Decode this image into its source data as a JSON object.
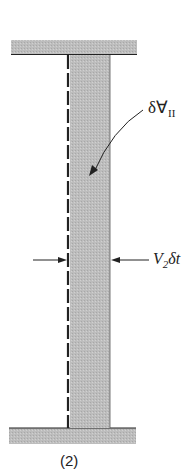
{
  "diagram": {
    "volume_label": "δⱯ",
    "volume_subscript": "II",
    "displacement_label_main": "V",
    "displacement_subscript": "2",
    "displacement_label_tail": "δt",
    "caption": "(2)",
    "colors": {
      "plate_fill": "#b4b4b4",
      "column_fill": "#c4c4c4",
      "line": "#222222"
    }
  }
}
